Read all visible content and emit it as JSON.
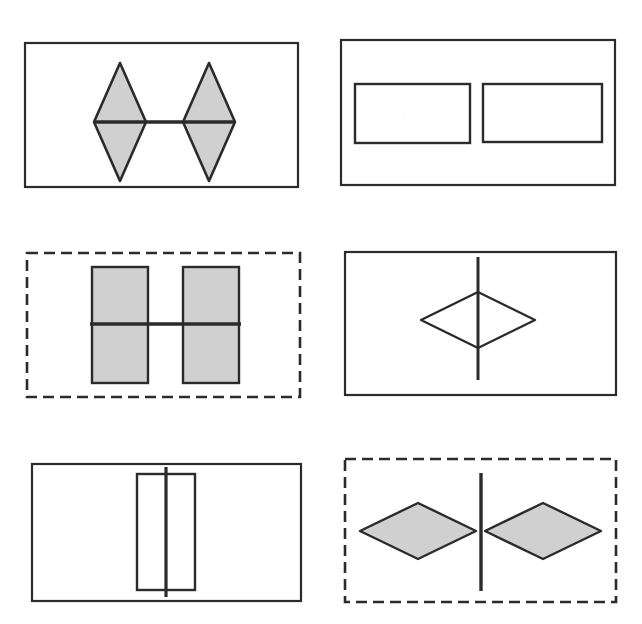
{
  "figure": {
    "width": 642,
    "height": 624,
    "background_color": "#ffffff",
    "ink_color": "#222222",
    "fill_gray": "#cfcfcf",
    "grid": {
      "rows": 3,
      "columns": 2
    }
  },
  "panels": [
    {
      "id": "panel-top-left",
      "position": "top-left",
      "frame": {
        "style": "solid",
        "x": 25,
        "y": 43,
        "width": 273,
        "height": 144,
        "stroke": "#2b2b2b",
        "stroke_width": 2.2
      },
      "shapes": {
        "kind": "two-vertical-diamonds-with-horizontal-line",
        "fill": "#d0d0d0",
        "stroke": "#2b2b2b",
        "stroke_width": 2.6,
        "left_diamond": {
          "cx": 120,
          "cy": 122,
          "rx": 26,
          "ry": 59
        },
        "right_diamond": {
          "cx": 209,
          "cy": 122,
          "rx": 26,
          "ry": 59
        },
        "line": {
          "x1": 94,
          "y1": 122,
          "x2": 235,
          "y2": 122,
          "width": 3.4
        }
      }
    },
    {
      "id": "panel-top-right",
      "position": "top-right",
      "frame": {
        "style": "solid",
        "x": 341,
        "y": 40,
        "width": 274,
        "height": 145,
        "stroke": "#2b2b2b",
        "stroke_width": 2.2
      },
      "shapes": {
        "kind": "two-horizontal-rectangles-with-horizontal-line",
        "fill": "none",
        "stroke": "#2b2b2b",
        "stroke_width": 2.4,
        "left_rect": {
          "x": 355,
          "y": 84,
          "width": 115,
          "height": 59
        },
        "right_rect": {
          "x": 483,
          "y": 84,
          "width": 119,
          "height": 58
        },
        "line": {
          "x1": 412,
          "y1": 113,
          "x2": 517,
          "y2": 113,
          "width": 2.6,
          "faded": true
        }
      }
    },
    {
      "id": "panel-middle-left",
      "position": "middle-left",
      "frame": {
        "style": "dashed",
        "x": 27,
        "y": 253,
        "width": 273,
        "height": 144,
        "stroke": "#2b2b2b",
        "stroke_width": 2.6,
        "dash_length": 11,
        "dash_gap": 6
      },
      "shapes": {
        "kind": "two-vertical-rectangles-with-horizontal-line",
        "fill": "#d0d0d0",
        "stroke": "#2b2b2b",
        "stroke_width": 2.4,
        "left_rect": {
          "x": 92,
          "y": 267,
          "width": 56,
          "height": 116
        },
        "right_rect": {
          "x": 183,
          "y": 267,
          "width": 56,
          "height": 116
        },
        "line": {
          "x1": 90,
          "y1": 324,
          "x2": 241,
          "y2": 324,
          "width": 3.4
        }
      }
    },
    {
      "id": "panel-middle-right",
      "position": "middle-right",
      "frame": {
        "style": "solid",
        "x": 345,
        "y": 252,
        "width": 271,
        "height": 143,
        "stroke": "#2b2b2b",
        "stroke_width": 2.2
      },
      "shapes": {
        "kind": "single-horizontal-diamond-with-vertical-line",
        "fill": "none",
        "stroke": "#2b2b2b",
        "stroke_width": 2.4,
        "diamond": {
          "cx": 478,
          "cy": 320,
          "rx": 57,
          "ry": 28
        },
        "line": {
          "x1": 478,
          "y1": 257,
          "x2": 478,
          "y2": 380,
          "width": 3.0
        }
      }
    },
    {
      "id": "panel-bottom-left",
      "position": "bottom-left",
      "frame": {
        "style": "solid",
        "x": 32,
        "y": 464,
        "width": 269,
        "height": 137,
        "stroke": "#2b2b2b",
        "stroke_width": 2.2
      },
      "shapes": {
        "kind": "single-vertical-rectangle-with-vertical-line",
        "fill": "none",
        "stroke": "#2b2b2b",
        "stroke_width": 2.4,
        "rect": {
          "x": 137,
          "y": 474,
          "width": 58,
          "height": 116
        },
        "line": {
          "x1": 166,
          "y1": 467,
          "x2": 166,
          "y2": 597,
          "width": 3.2
        }
      }
    },
    {
      "id": "panel-bottom-right",
      "position": "bottom-right",
      "frame": {
        "style": "dashed",
        "x": 345,
        "y": 459,
        "width": 271,
        "height": 143,
        "stroke": "#2b2b2b",
        "stroke_width": 2.6,
        "dash_length": 11,
        "dash_gap": 6
      },
      "shapes": {
        "kind": "two-horizontal-diamonds-with-vertical-line",
        "fill": "#d0d0d0",
        "stroke": "#2b2b2b",
        "stroke_width": 2.4,
        "left_diamond": {
          "cx": 418,
          "cy": 531,
          "rx": 58,
          "ry": 28
        },
        "right_diamond": {
          "cx": 543,
          "cy": 531,
          "rx": 58,
          "ry": 28
        },
        "line": {
          "x1": 481,
          "y1": 473,
          "x2": 481,
          "y2": 591,
          "width": 3.4
        }
      }
    }
  ]
}
